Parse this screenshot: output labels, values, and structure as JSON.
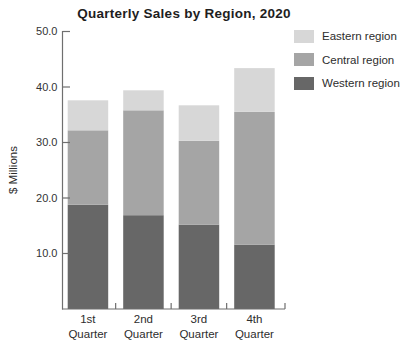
{
  "title": "Quarterly Sales by Region, 2020",
  "chart_data": {
    "type": "bar",
    "stacked": true,
    "title": "Quarterly Sales by Region, 2020",
    "xlabel": "",
    "ylabel": "$ Millions",
    "categories": [
      "1st Quarter",
      "2nd Quarter",
      "3rd Quarter",
      "4th Quarter"
    ],
    "series": [
      {
        "name": "Western region",
        "color": "#676767",
        "values": [
          18.8,
          16.9,
          15.2,
          11.6
        ]
      },
      {
        "name": "Central region",
        "color": "#a5a5a5",
        "values": [
          13.4,
          18.9,
          15.1,
          23.9
        ]
      },
      {
        "name": "Eastern region",
        "color": "#d7d7d7",
        "values": [
          5.4,
          3.6,
          6.4,
          7.9
        ]
      }
    ],
    "totals": [
      37.6,
      39.4,
      36.7,
      43.4
    ],
    "ylim": [
      0,
      50
    ],
    "yticks": [
      10,
      20,
      30,
      40,
      50
    ],
    "ytick_labels": [
      "10.0",
      "20.0",
      "30.0",
      "40.0",
      "50.0"
    ],
    "grid": false,
    "legend_position": "top-right",
    "legend_order": [
      "Eastern region",
      "Central region",
      "Western region"
    ]
  },
  "colors": {
    "axis": "#6f6f6f",
    "tick_text": "#333333",
    "label_text": "#2d2d2d",
    "background": "#ffffff"
  }
}
